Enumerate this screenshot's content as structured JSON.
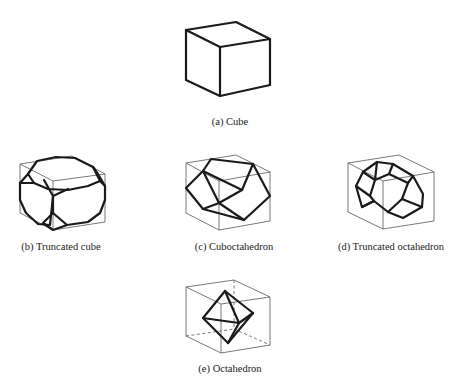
{
  "figure": {
    "panels": [
      {
        "id": "a",
        "label": "(a) Cube",
        "solid": "Cube"
      },
      {
        "id": "b",
        "label": "(b) Truncated cube",
        "solid": "Truncated cube"
      },
      {
        "id": "c",
        "label": "(c) Cuboctahedron",
        "solid": "Cuboctahedron"
      },
      {
        "id": "d",
        "label": "(d) Truncated octahedron",
        "solid": "Truncated octahedron"
      },
      {
        "id": "e",
        "label": "(e) Octahedron",
        "solid": "Octahedron"
      }
    ]
  },
  "colors": {
    "background": "#ffffff",
    "edge_thick": "#1a1a1a",
    "edge_thin": "#555555",
    "text": "#222222"
  }
}
